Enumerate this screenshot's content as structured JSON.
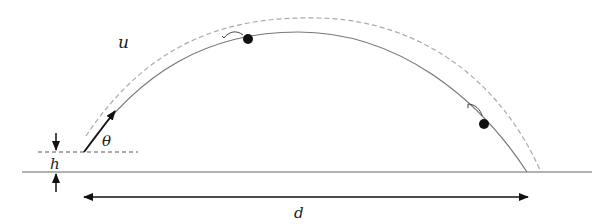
{
  "diagram": {
    "labels": {
      "velocity": "u",
      "angle": "θ",
      "height": "h",
      "distance": "d"
    },
    "elements": {
      "ground_line": {
        "x1": 22,
        "x2": 592,
        "y": 172
      },
      "launch_level_line": {
        "x1": 38,
        "x2": 138,
        "y": 152,
        "style": "dashed"
      },
      "launch_point": {
        "x": 84,
        "y": 152
      },
      "landing_point": {
        "x": 527,
        "y": 172
      },
      "solid_trajectory_apex": {
        "x": 298,
        "y": 32
      },
      "dashed_trajectory_apex": {
        "x": 318,
        "y": 18
      },
      "marked_points": [
        {
          "x": 248,
          "y": 39
        },
        {
          "x": 484,
          "y": 124
        }
      ],
      "distance_arrow": {
        "x1": 84,
        "x2": 528,
        "y": 197
      }
    },
    "colors": {
      "solid_curve": "#777777",
      "dashed_curve": "#aaaaaa",
      "ink": "#111111"
    }
  }
}
